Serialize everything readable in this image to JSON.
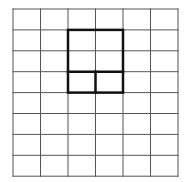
{
  "diagram": {
    "title": "",
    "grid": {
      "columns": 6,
      "rows": 8,
      "left": 13,
      "top": 9,
      "cell_width": 27.5,
      "cell_height": 20.9,
      "line_color": "#555555"
    },
    "highlight": {
      "color": "#111111",
      "outline": {
        "col": 2,
        "row": 1,
        "cols": 2,
        "rows": 3
      },
      "inner_lines": [
        {
          "type": "horizontal",
          "row": 3,
          "col_start": 2,
          "col_end": 4
        },
        {
          "type": "vertical",
          "col": 3,
          "row_start": 3,
          "row_end": 4
        }
      ]
    }
  }
}
